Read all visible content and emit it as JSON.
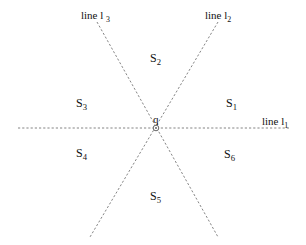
{
  "diagram": {
    "center": {
      "label": "q",
      "x": 156,
      "y": 128
    },
    "lines": [
      {
        "id": "l1",
        "name": "line l",
        "sub": "1",
        "x1": 18,
        "y1": 128,
        "x2": 290,
        "y2": 128,
        "label_x": 262,
        "label_y": 125
      },
      {
        "id": "l2",
        "name": "line l",
        "sub": "2",
        "x1": 218,
        "y1": 22,
        "x2": 90,
        "y2": 237,
        "label_x": 205,
        "label_y": 19
      },
      {
        "id": "l3",
        "name": "line l ",
        "sub": "3",
        "x1": 97,
        "y1": 22,
        "x2": 218,
        "y2": 237,
        "label_x": 81,
        "label_y": 19
      }
    ],
    "sectors": [
      {
        "name": "S",
        "sub": "1",
        "x": 226,
        "y": 107
      },
      {
        "name": "S",
        "sub": "2",
        "x": 150,
        "y": 62
      },
      {
        "name": "S",
        "sub": "3",
        "x": 76,
        "y": 107
      },
      {
        "name": "S",
        "sub": "4",
        "x": 76,
        "y": 157
      },
      {
        "name": "S",
        "sub": "5",
        "x": 150,
        "y": 200
      },
      {
        "name": "S",
        "sub": "6",
        "x": 224,
        "y": 158
      }
    ],
    "colors": {
      "line": "#777777",
      "text": "#111111",
      "background": "#ffffff"
    }
  }
}
